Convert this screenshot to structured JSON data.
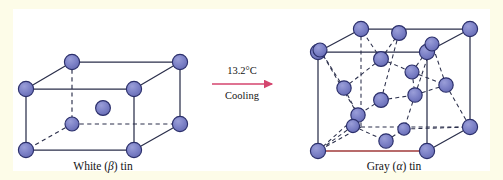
{
  "figure": {
    "name": "tin-allotropes-phase-transition",
    "background_color": "#fdfce8",
    "panel_color": "#ffffff",
    "atom_fill": "#7b80c6",
    "atom_stroke": "#2b2f6b",
    "edge_color": "#2b2f4b",
    "dashed_color": "#2b2f4b",
    "arrow_color": "#d4456e",
    "highlight_edge_color": "#a03a3a"
  },
  "left_structure": {
    "label_main": "White (",
    "label_symbol": "β",
    "label_tail": ") tin",
    "label_full": "White (β) tin",
    "type": "body-centered tetragonal",
    "atom_count": 9
  },
  "right_structure": {
    "label_main": "Gray (",
    "label_symbol": "α",
    "label_tail": ") tin",
    "label_full": "Gray (α) tin",
    "type": "diamond cubic",
    "atom_count": 18
  },
  "arrow": {
    "temperature": "13.2°C",
    "process": "Cooling",
    "direction": "left-to-right"
  }
}
